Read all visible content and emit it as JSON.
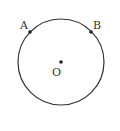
{
  "diagram": {
    "type": "circle-geometry",
    "circle": {
      "cx": 61,
      "cy": 62,
      "r": 43,
      "stroke": "#333333"
    },
    "points": [
      {
        "label": "A",
        "x": 30,
        "y": 32,
        "label_x": 20,
        "label_y": 29
      },
      {
        "label": "B",
        "x": 91,
        "y": 32,
        "label_x": 93,
        "label_y": 29
      },
      {
        "label": "O",
        "x": 61,
        "y": 62,
        "label_x": 52,
        "label_y": 76
      }
    ]
  }
}
